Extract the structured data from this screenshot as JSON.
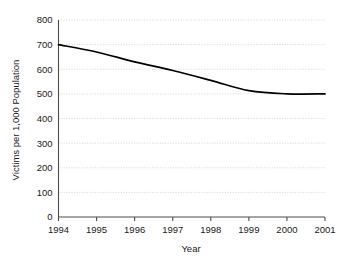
{
  "chart_data": {
    "type": "line",
    "title": "",
    "xlabel": "Year",
    "ylabel": "Victims per 1,000 Population",
    "categories": [
      "1994",
      "1995",
      "1996",
      "1997",
      "1998",
      "1999",
      "2000",
      "2001"
    ],
    "x": [
      1994,
      1995,
      1996,
      1997,
      1998,
      1999,
      2000,
      2001
    ],
    "values": [
      700,
      670,
      630,
      595,
      555,
      513,
      500,
      500
    ],
    "series": [
      {
        "name": "Victims per 1,000 Population",
        "values": [
          700,
          670,
          630,
          595,
          555,
          513,
          500,
          500
        ],
        "color": "#000000"
      }
    ],
    "ylim": [
      0,
      800
    ],
    "xlim": [
      1994,
      2001
    ],
    "ytick_labels": [
      "0",
      "100",
      "200",
      "300",
      "400",
      "500",
      "600",
      "700",
      "800"
    ],
    "ytick_values": [
      0,
      100,
      200,
      300,
      400,
      500,
      600,
      700,
      800
    ],
    "xtick_labels": [
      "1994",
      "1995",
      "1996",
      "1997",
      "1998",
      "1999",
      "2000",
      "2001"
    ],
    "grid": "horizontal-dotted",
    "legend": "none",
    "annotations": [],
    "colors": {
      "background": "#ffffff",
      "line": "#000000",
      "grid": "#c8c8c8",
      "axis": "#4d4d4d",
      "text": "#1a1a1a"
    }
  }
}
